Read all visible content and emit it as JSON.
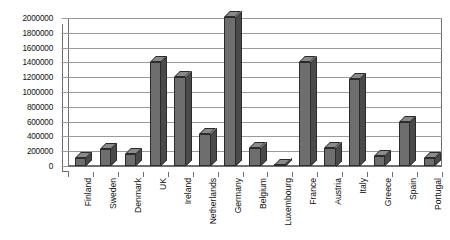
{
  "chart_data": {
    "type": "bar",
    "title": "",
    "subtitle": "",
    "xlabel": "",
    "ylabel": "",
    "ylim": [
      0,
      2000000
    ],
    "ytick_step": 200000,
    "yticks": [
      0,
      200000,
      400000,
      600000,
      800000,
      1000000,
      1200000,
      1400000,
      1600000,
      1800000,
      2000000
    ],
    "ytick_labels": [
      "0",
      "200000",
      "400000",
      "600000",
      "800000",
      "1000000",
      "1200000",
      "1400000",
      "1600000",
      "1800000",
      "2000000"
    ],
    "grid": true,
    "legend": false,
    "legend_position": "none",
    "style": "3d-column-grayscale",
    "bar_color": "#6e6e6e",
    "bar_side_color": "#4a4a4a",
    "bar_top_color": "#8a8a8a",
    "bar_outline_color": "#2b2b2b",
    "gridline_color": "#9a9a9a",
    "axis_color": "#6f6f6f",
    "background_color": "#ffffff",
    "categories": [
      "Finland",
      "Sweden",
      "Denmark",
      "UK",
      "Ireland",
      "Netherlands",
      "Germany",
      "Belgium",
      "Luxembourg",
      "France",
      "Austria",
      "Italy",
      "Greece",
      "Spain",
      "Portugal"
    ],
    "values": [
      110000,
      230000,
      160000,
      1400000,
      1200000,
      430000,
      2010000,
      240000,
      15000,
      1400000,
      250000,
      1170000,
      140000,
      600000,
      110000
    ]
  }
}
